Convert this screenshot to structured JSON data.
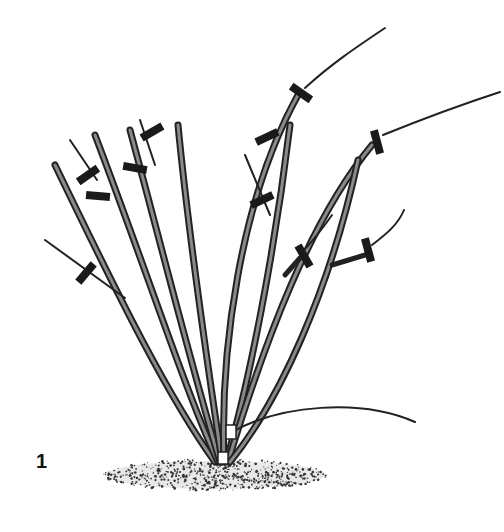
{
  "figure": {
    "label": "1",
    "colors": {
      "ink": "#1a1a1a",
      "cane_fill": "#8a8a8a",
      "background": "#ffffff"
    }
  }
}
